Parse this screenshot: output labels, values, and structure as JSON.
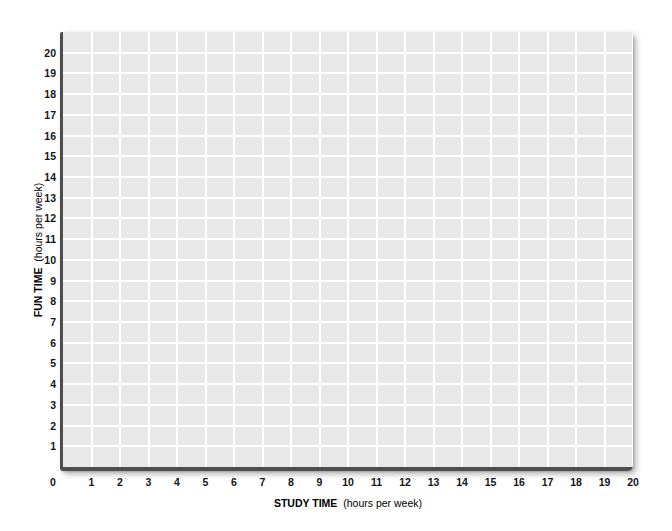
{
  "chart_data": {
    "type": "scatter",
    "title": "",
    "xlabel": "STUDY TIME (hours per week)",
    "xlabel_bold": "STUDY TIME",
    "xlabel_unit": "(hours per week)",
    "ylabel": "FUN TIME (hours per week)",
    "ylabel_bold": "FUN TIME",
    "ylabel_unit": "(hours per week)",
    "xlim": [
      0,
      20
    ],
    "ylim": [
      0,
      21
    ],
    "x_ticks": [
      0,
      1,
      2,
      3,
      4,
      5,
      6,
      7,
      8,
      9,
      10,
      11,
      12,
      13,
      14,
      15,
      16,
      17,
      18,
      19,
      20
    ],
    "y_ticks": [
      1,
      2,
      3,
      4,
      5,
      6,
      7,
      8,
      9,
      10,
      11,
      12,
      13,
      14,
      15,
      16,
      17,
      18,
      19,
      20
    ],
    "grid": true,
    "legend": null,
    "series": []
  },
  "style": {
    "page_bg": "#ffffff",
    "plot_bg": "#e8e8e8",
    "grid_color": "#ffffff",
    "axis_color": "#4e4e4e",
    "tick_color": "#151515",
    "title_color": "#000000"
  }
}
